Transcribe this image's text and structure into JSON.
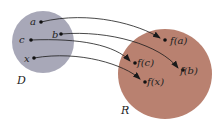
{
  "diagram": {
    "domain_set": {
      "label": "D",
      "color": "#a8a8b8"
    },
    "range_set": {
      "label": "R",
      "color": "#b98170"
    },
    "domain_points": [
      {
        "label": "a"
      },
      {
        "label": "b"
      },
      {
        "label": "c"
      },
      {
        "label": "x"
      }
    ],
    "range_points": [
      {
        "label": "f(a)"
      },
      {
        "label": "f(b)"
      },
      {
        "label": "f(c)"
      },
      {
        "label": "f(x)"
      }
    ],
    "mappings": [
      {
        "from": "a",
        "to": "f(a)"
      },
      {
        "from": "b",
        "to": "f(b)"
      },
      {
        "from": "c",
        "to": "f(c)"
      },
      {
        "from": "x",
        "to": "f(x)"
      }
    ]
  }
}
